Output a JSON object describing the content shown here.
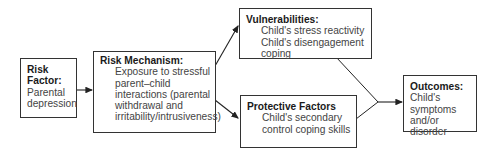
{
  "diagram": {
    "nodes": [
      {
        "id": "risk_factor",
        "title": "Risk Factor:",
        "title_lines": [
          "Risk",
          "Factor:"
        ],
        "body_lines": [
          "Parental",
          "depression"
        ]
      },
      {
        "id": "risk_mechanism",
        "title": "Risk Mechanism:",
        "body_lines": [
          "Exposure to stressful",
          "parent–child",
          "interactions (parental",
          "withdrawal and",
          "irritability/intrusiveness)"
        ]
      },
      {
        "id": "vulnerabilities",
        "title": "Vulnerabilities:",
        "body_lines": [
          "Child's stress reactivity",
          "Child's disengagement",
          "coping"
        ]
      },
      {
        "id": "protective_factors",
        "title": "Protective Factors",
        "body_lines": [
          "Child's secondary",
          "control coping skills"
        ]
      },
      {
        "id": "outcomes",
        "title": "Outcomes:",
        "body_lines": [
          "Child's",
          "symptoms",
          "and/or disorder"
        ]
      }
    ],
    "edges": [
      {
        "from": "risk_factor",
        "to": "risk_mechanism",
        "arrow": true
      },
      {
        "from": "risk_mechanism",
        "to": "vulnerabilities",
        "arrow": true
      },
      {
        "from": "risk_mechanism",
        "to": "protective_factors",
        "arrow": true
      },
      {
        "from": "vulnerabilities",
        "to": "outcomes",
        "arrow": true,
        "merged": true
      },
      {
        "from": "protective_factors",
        "to": "outcomes",
        "arrow": true,
        "merged": true
      }
    ]
  }
}
